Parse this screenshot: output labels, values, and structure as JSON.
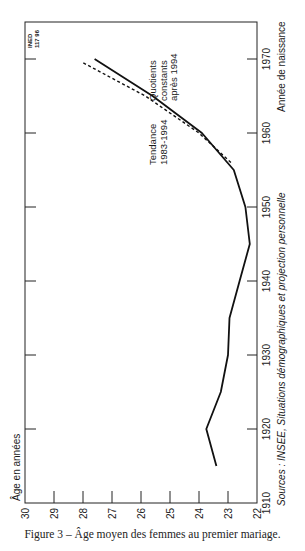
{
  "caption": "Figure 3 – Âge moyen des femmes au premier mariage.",
  "credit": {
    "line1": "INED",
    "line2": "117 96"
  },
  "source": "Sources : INSEE, Situations démographiques et projection personnelle",
  "annotations": {
    "quotients": {
      "line1": "Quotients",
      "line2": "constants",
      "line3": "après 1994"
    },
    "tendance": {
      "line1": "Tendance",
      "line2": "1983-1994"
    }
  },
  "axes": {
    "age_label": "Âge en années",
    "year_label": "Année de naissance"
  },
  "chart_data": {
    "type": "line",
    "title": "Âge moyen des femmes au premier mariage",
    "orientation": "rotated 90° (years run upward along right edge, age along bottom increasing leftward)",
    "xlabel": "Année de naissance",
    "ylabel": "Âge en années",
    "xlim": [
      1910,
      1975
    ],
    "ylim": [
      22,
      30
    ],
    "x_ticks": [
      1910,
      1920,
      1930,
      1940,
      1950,
      1960,
      1970
    ],
    "y_ticks": [
      22,
      23,
      24,
      25,
      26,
      27,
      28,
      29,
      30
    ],
    "grid": false,
    "series": [
      {
        "name": "Tendance 1983-1994",
        "style": "solid",
        "x": [
          1915,
          1920,
          1925,
          1930,
          1935,
          1940,
          1945,
          1950,
          1955,
          1960,
          1965,
          1970
        ],
        "values": [
          23.4,
          23.75,
          23.25,
          23.0,
          22.95,
          22.6,
          22.25,
          22.4,
          22.8,
          23.9,
          25.6,
          27.6
        ]
      },
      {
        "name": "Quotients constants après 1994",
        "style": "dashed",
        "x": [
          1956,
          1960,
          1965,
          1969.5
        ],
        "values": [
          22.9,
          24.0,
          25.85,
          28.0
        ]
      }
    ]
  }
}
